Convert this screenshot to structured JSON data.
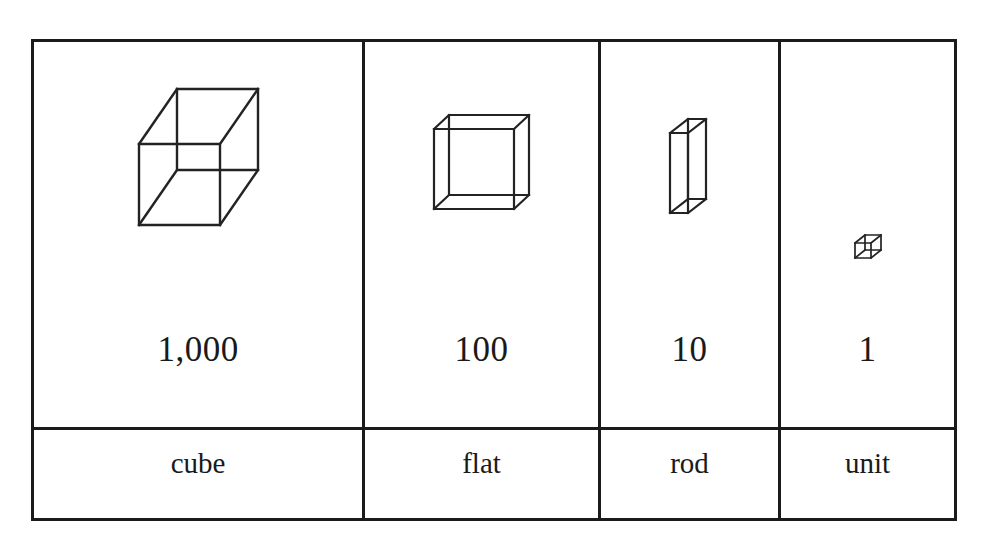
{
  "figure": {
    "type": "place-value-blocks-table",
    "columns": [
      {
        "block_icon": "thousands-cube-icon",
        "value": "1,000",
        "name": "cube"
      },
      {
        "block_icon": "hundreds-flat-icon",
        "value": "100",
        "name": "flat"
      },
      {
        "block_icon": "tens-rod-icon",
        "value": "10",
        "name": "rod"
      },
      {
        "block_icon": "ones-unit-icon",
        "value": "1",
        "name": "unit"
      }
    ],
    "colors": {
      "border": "#1b1b1b",
      "line": "#232323",
      "text": "#1a1a1a",
      "background": "#ffffff"
    }
  }
}
